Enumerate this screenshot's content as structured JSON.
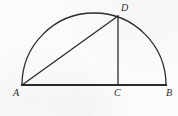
{
  "figure": {
    "kind": "geometry-diagram",
    "canvas": {
      "width": 178,
      "height": 116
    },
    "colors": {
      "background": "#fbfbfb",
      "stroke": "#2b2b2b",
      "label": "#2b2b2b"
    },
    "stroke_widths": {
      "diameter": 2.1,
      "arc": 1.3,
      "chord": 1.3,
      "altitude": 1.3
    },
    "semicircle": {
      "name": "arc-AB",
      "center": {
        "x": 94,
        "y": 85
      },
      "radius_x": 72,
      "radius_y": 72,
      "start": {
        "x": 22,
        "y": 85
      },
      "end": {
        "x": 166,
        "y": 85
      },
      "apex": {
        "x": 94,
        "y": 13
      }
    },
    "points": [
      {
        "id": "A",
        "label": "A",
        "x": 22,
        "y": 85,
        "label_x": 13,
        "label_y": 88,
        "role": "left-endpoint-of-diameter"
      },
      {
        "id": "B",
        "label": "B",
        "x": 166,
        "y": 85,
        "label_x": 166,
        "label_y": 88,
        "role": "right-endpoint-of-diameter"
      },
      {
        "id": "C",
        "label": "C",
        "x": 118,
        "y": 85,
        "label_x": 114,
        "label_y": 88,
        "role": "foot-of-altitude-on-diameter"
      },
      {
        "id": "D",
        "label": "D",
        "x": 118,
        "y": 16,
        "label_x": 121,
        "label_y": 3,
        "role": "point-on-arc"
      }
    ],
    "segments": [
      {
        "id": "AB",
        "name": "diameter-AB",
        "from": "A",
        "to": "B",
        "style": "thick"
      },
      {
        "id": "AD",
        "name": "chord-AD",
        "from": "A",
        "to": "D",
        "style": "thin"
      },
      {
        "id": "DC",
        "name": "altitude-DC",
        "from": "D",
        "to": "C",
        "style": "thin"
      }
    ]
  }
}
